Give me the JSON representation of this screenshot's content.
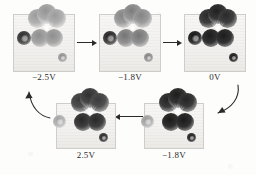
{
  "figure": {
    "type": "stm-image-sequence",
    "background_color": "#fdfdfc",
    "ink_color": "#2a2a2a",
    "panel_fill": "#f4f3f1",
    "panel_border": "#cfcdc9"
  },
  "panels": [
    {
      "id": "panel-1",
      "label": "−2.5V",
      "voltage": "-2.5",
      "unit": "V",
      "row": "top",
      "order": 1,
      "contrast": "light",
      "features": {
        "crown_lobes": 3,
        "lower_lobes": 2,
        "left_satellite_dot": 1,
        "bottom_right_speckle": 1,
        "radial_streaks": 7
      }
    },
    {
      "id": "panel-2",
      "label": "−1.8V",
      "voltage": "-1.8",
      "unit": "V",
      "row": "top",
      "order": 2,
      "contrast": "medium",
      "features": {
        "crown_lobes": 3,
        "lower_lobes": 2,
        "left_satellite_dot": 1,
        "bottom_right_speckle": 1,
        "radial_streaks": 7
      }
    },
    {
      "id": "panel-3",
      "label": "0V",
      "voltage": "0",
      "unit": "V",
      "row": "top",
      "order": 3,
      "contrast": "dark",
      "features": {
        "crown_lobes": 3,
        "lower_lobes": 2,
        "left_satellite_dot": 1,
        "bottom_right_speckle": 1,
        "radial_streaks": 7
      }
    },
    {
      "id": "panel-4",
      "label": "2.5V",
      "voltage": "2.5",
      "unit": "V",
      "row": "bottom",
      "order": 5,
      "contrast": "dark",
      "features": {
        "crown_lobes": 3,
        "lower_lobes": 2,
        "left_satellite_dot": 1,
        "bottom_right_speckle": 1,
        "radial_streaks": 7
      }
    },
    {
      "id": "panel-5",
      "label": "−1.8V",
      "voltage": "-1.8",
      "unit": "V",
      "row": "bottom",
      "order": 4,
      "contrast": "dark",
      "features": {
        "crown_lobes": 3,
        "lower_lobes": 2,
        "left_satellite_dot": 1,
        "bottom_right_speckle": 1,
        "radial_streaks": 7
      }
    }
  ],
  "arrows": [
    {
      "id": "arrow-1",
      "from": "panel-1",
      "to": "panel-2",
      "shape": "straight",
      "direction": "right"
    },
    {
      "id": "arrow-2",
      "from": "panel-2",
      "to": "panel-3",
      "shape": "straight",
      "direction": "right"
    },
    {
      "id": "arrow-3",
      "from": "panel-3",
      "to": "panel-5",
      "shape": "curved",
      "direction": "down-left"
    },
    {
      "id": "arrow-4",
      "from": "panel-5",
      "to": "panel-4",
      "shape": "straight",
      "direction": "left"
    },
    {
      "id": "arrow-5",
      "from": "panel-4",
      "to": "panel-1",
      "shape": "curved",
      "direction": "up-left"
    }
  ]
}
